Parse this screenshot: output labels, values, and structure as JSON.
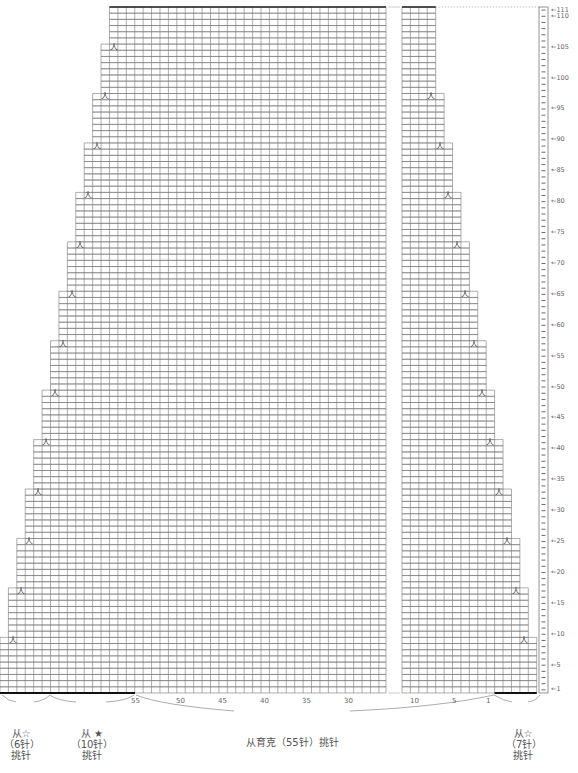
{
  "chart": {
    "rows": 111,
    "row_height": 6.18,
    "col_width": 8.42,
    "top_y": 7,
    "left_grid": {
      "x0": 0,
      "cols_at_bottom": 46,
      "right_edge_x": 386,
      "decrease_rows": [
        9,
        17,
        25,
        33,
        41,
        49,
        57,
        65,
        73,
        81,
        89,
        97,
        105
      ]
    },
    "right_grid": {
      "x0": 402,
      "cols_at_bottom": 16,
      "decrease_rows": [
        9,
        17,
        25,
        33,
        41,
        49,
        57,
        65,
        73,
        81,
        89,
        97
      ]
    },
    "ruler": {
      "x": 539,
      "width": 9,
      "labels": [
        "1",
        "5",
        "10",
        "15",
        "20",
        "25",
        "30",
        "35",
        "40",
        "45",
        "50",
        "55",
        "60",
        "65",
        "70",
        "75",
        "80",
        "85",
        "90",
        "95",
        "100",
        "105",
        "110",
        "111"
      ],
      "arrow": "←"
    },
    "decrease_symbol": "人"
  },
  "bottom_axis": {
    "left_labels": [
      {
        "text": "55",
        "x": 135
      },
      {
        "text": "50",
        "x": 180
      },
      {
        "text": "45",
        "x": 222
      },
      {
        "text": "40",
        "x": 264
      },
      {
        "text": "35",
        "x": 306
      },
      {
        "text": "30",
        "x": 348
      }
    ],
    "right_labels": [
      {
        "text": "10",
        "x": 414
      },
      {
        "text": "5",
        "x": 456
      },
      {
        "text": "1",
        "x": 490
      }
    ]
  },
  "pickups": {
    "left_star_outline": {
      "line1": "从☆",
      "line2": "（6针）",
      "line3": "挑针"
    },
    "left_star_filled": {
      "line1": "从 ★",
      "line2": "（10针）",
      "line3": "挑针"
    },
    "main": {
      "text": "从育克（55针）挑针"
    },
    "right_star_outline": {
      "line1": "从☆",
      "line2": "（7针）",
      "line3": "挑针"
    }
  }
}
